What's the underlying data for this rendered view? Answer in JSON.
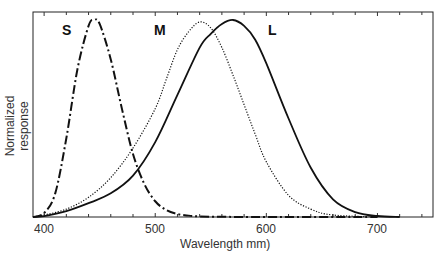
{
  "chart_data": {
    "type": "line",
    "title": "",
    "xlabel": "Wavelength mm)",
    "ylabel": "Normalized response",
    "xlim": [
      390,
      750
    ],
    "ylim": [
      0,
      1
    ],
    "grid": false,
    "legend": "inline labels",
    "xticks": [
      400,
      500,
      600,
      700
    ],
    "series": [
      {
        "name": "S",
        "style": "dash-dot",
        "peak_nm": 445,
        "x": [
          390,
          400,
          410,
          420,
          430,
          440,
          445,
          450,
          460,
          470,
          480,
          490,
          500,
          510,
          520,
          530,
          540,
          560,
          600,
          700
        ],
        "y": [
          0.0,
          0.02,
          0.12,
          0.4,
          0.75,
          0.97,
          1.0,
          0.98,
          0.8,
          0.55,
          0.32,
          0.17,
          0.08,
          0.035,
          0.015,
          0.007,
          0.003,
          0.001,
          0.0,
          0.0
        ]
      },
      {
        "name": "M",
        "style": "dotted",
        "peak_nm": 540,
        "x": [
          390,
          400,
          420,
          440,
          460,
          480,
          500,
          510,
          520,
          530,
          540,
          550,
          560,
          570,
          580,
          590,
          600,
          620,
          640,
          660,
          700
        ],
        "y": [
          0.0,
          0.01,
          0.04,
          0.1,
          0.2,
          0.35,
          0.55,
          0.7,
          0.85,
          0.94,
          0.99,
          0.96,
          0.86,
          0.72,
          0.57,
          0.42,
          0.28,
          0.11,
          0.04,
          0.01,
          0.0
        ]
      },
      {
        "name": "L",
        "style": "solid",
        "peak_nm": 570,
        "x": [
          390,
          400,
          420,
          440,
          460,
          480,
          500,
          520,
          540,
          550,
          560,
          570,
          580,
          590,
          600,
          620,
          640,
          660,
          680,
          700,
          720
        ],
        "y": [
          0.0,
          0.005,
          0.03,
          0.07,
          0.12,
          0.21,
          0.38,
          0.62,
          0.86,
          0.93,
          0.98,
          1.0,
          0.97,
          0.9,
          0.78,
          0.5,
          0.25,
          0.09,
          0.025,
          0.005,
          0.0
        ]
      }
    ],
    "annotations": [
      "S",
      "M",
      "L"
    ]
  },
  "labels": {
    "ylabel": "Normalized response",
    "xlabel": "Wavelength mm)",
    "ticks": [
      "400",
      "500",
      "600",
      "700"
    ],
    "curves": {
      "S": "S",
      "M": "M",
      "L": "L"
    }
  }
}
